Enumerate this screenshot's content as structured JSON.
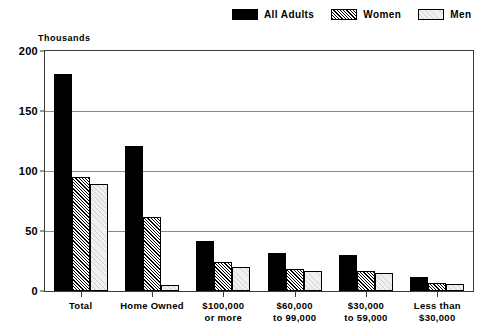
{
  "chart_data": {
    "type": "bar",
    "title": "",
    "subtitle": "",
    "units_label": "Thousands",
    "xlabel": "",
    "ylabel": "Thousands",
    "ylim": [
      0,
      200
    ],
    "yticks": [
      0,
      50,
      100,
      150,
      200
    ],
    "ytick_labels": [
      "0",
      "50",
      "100",
      "150",
      "200"
    ],
    "grid": true,
    "legend_position": "top-right",
    "categories": [
      "Total",
      "Home Owned",
      "$100,000\nor more",
      "$60,000\nto 99,000",
      "$30,000\nto 59,000",
      "Less than\n$30,000"
    ],
    "category_lines": [
      [
        "Total"
      ],
      [
        "Home Owned"
      ],
      [
        "$100,000",
        "or more"
      ],
      [
        "$60,000",
        "to 99,000"
      ],
      [
        "$30,000",
        "to 59,000"
      ],
      [
        "Less than",
        "$30,000"
      ]
    ],
    "series": [
      {
        "name": "All Adults",
        "fill": "solid",
        "color": "#000000",
        "values": [
          181,
          121,
          42,
          32,
          30,
          12
        ]
      },
      {
        "name": "Women",
        "fill": "hatch",
        "color": "#ffffff",
        "values": [
          95,
          62,
          24,
          18,
          17,
          7
        ]
      },
      {
        "name": "Men",
        "fill": "light",
        "color": "#f0f0f0",
        "values": [
          89,
          5,
          20,
          17,
          15,
          6
        ]
      }
    ]
  },
  "legend": {
    "items": [
      {
        "label": "All Adults",
        "fill": "solid"
      },
      {
        "label": "Women",
        "fill": "hatch"
      },
      {
        "label": "Men",
        "fill": "light"
      }
    ]
  }
}
